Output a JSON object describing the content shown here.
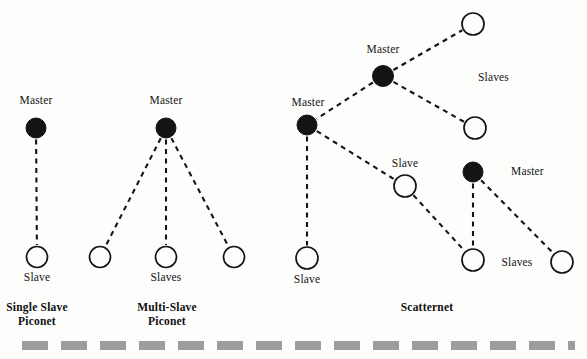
{
  "figure": {
    "width": 587,
    "height": 359,
    "background_color": "#fdfdfc",
    "ink_color": "#141414",
    "rule_color": "#9a9a9a"
  },
  "groups": [
    {
      "id": "single-slave-piconet",
      "label": "Single Slave\nPiconet",
      "x": 37,
      "y": 307
    },
    {
      "id": "multi-slave-piconet",
      "label": "Multi-Slave\nPiconet",
      "x": 167,
      "y": 307
    },
    {
      "id": "scatternet",
      "label": "Scatternet",
      "x": 427,
      "y": 307
    }
  ],
  "nodes": [
    {
      "id": "m1",
      "type": "master",
      "cx": 36,
      "cy": 128,
      "r": 10
    },
    {
      "id": "s1",
      "type": "slave",
      "cx": 37,
      "cy": 257,
      "r": 10.5
    },
    {
      "id": "m2",
      "type": "master",
      "cx": 166,
      "cy": 128,
      "r": 10
    },
    {
      "id": "s2a",
      "type": "slave",
      "cx": 100,
      "cy": 257,
      "r": 10.5
    },
    {
      "id": "s2b",
      "type": "slave",
      "cx": 166,
      "cy": 257,
      "r": 10.5
    },
    {
      "id": "s2c",
      "type": "slave",
      "cx": 234,
      "cy": 257,
      "r": 10.5
    },
    {
      "id": "m3",
      "type": "master",
      "cx": 307,
      "cy": 125,
      "r": 10
    },
    {
      "id": "m4",
      "type": "master",
      "cx": 383,
      "cy": 76,
      "r": 10.5
    },
    {
      "id": "m5",
      "type": "master",
      "cx": 473,
      "cy": 172,
      "r": 10
    },
    {
      "id": "s3a",
      "type": "slave",
      "cx": 473,
      "cy": 24,
      "r": 11
    },
    {
      "id": "s3b",
      "type": "slave",
      "cx": 475,
      "cy": 128,
      "r": 11
    },
    {
      "id": "s3c",
      "type": "slave",
      "cx": 405,
      "cy": 186,
      "r": 11
    },
    {
      "id": "s3d",
      "type": "slave",
      "cx": 307,
      "cy": 258,
      "r": 11
    },
    {
      "id": "s3e",
      "type": "slave",
      "cx": 473,
      "cy": 260,
      "r": 11
    },
    {
      "id": "s3f",
      "type": "slave",
      "cx": 562,
      "cy": 262,
      "r": 11
    }
  ],
  "links": [
    {
      "from": "m1",
      "to": "s1"
    },
    {
      "from": "m2",
      "to": "s2a"
    },
    {
      "from": "m2",
      "to": "s2b"
    },
    {
      "from": "m2",
      "to": "s2c"
    },
    {
      "from": "m4",
      "to": "s3a"
    },
    {
      "from": "m4",
      "to": "s3b"
    },
    {
      "from": "m4",
      "to": "m3"
    },
    {
      "from": "m3",
      "to": "s3d"
    },
    {
      "from": "m3",
      "to": "s3c"
    },
    {
      "from": "s3c",
      "to": "s3e"
    },
    {
      "from": "m5",
      "to": "s3e"
    },
    {
      "from": "m5",
      "to": "s3f"
    }
  ],
  "labels": [
    {
      "id": "label-master-1",
      "text": "Master",
      "x": 36,
      "y": 101,
      "anchor": "center"
    },
    {
      "id": "label-slave-1",
      "text": "Slave",
      "x": 37,
      "y": 278,
      "anchor": "center"
    },
    {
      "id": "label-master-2",
      "text": "Master",
      "x": 166,
      "y": 101,
      "anchor": "center"
    },
    {
      "id": "label-slaves-2",
      "text": "Slaves",
      "x": 166,
      "y": 278,
      "anchor": "center"
    },
    {
      "id": "label-master-3",
      "text": "Master",
      "x": 308,
      "y": 103,
      "anchor": "center"
    },
    {
      "id": "label-master-4",
      "text": "Master",
      "x": 383,
      "y": 50,
      "anchor": "center"
    },
    {
      "id": "label-master-5",
      "text": "Master",
      "x": 511,
      "y": 172,
      "anchor": "left"
    },
    {
      "id": "label-slaves-3",
      "text": "Slaves",
      "x": 478,
      "y": 78,
      "anchor": "left"
    },
    {
      "id": "label-slave-3c",
      "text": "Slave",
      "x": 405,
      "y": 164,
      "anchor": "center"
    },
    {
      "id": "label-slave-3d",
      "text": "Slave",
      "x": 307,
      "y": 280,
      "anchor": "center"
    },
    {
      "id": "label-slaves-bottom",
      "text": "Slaves",
      "x": 517,
      "y": 263,
      "anchor": "center"
    }
  ],
  "bottom_rule": {
    "id": "bottom-dashed-rule",
    "y": 341,
    "height": 9,
    "color": "#9d9d9d",
    "dash": "26 13"
  }
}
